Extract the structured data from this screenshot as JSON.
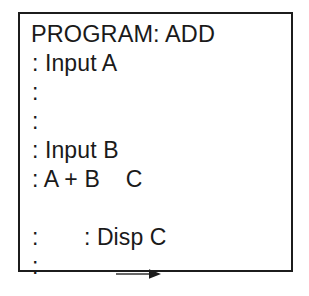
{
  "frame": {
    "border_color": "#1c1c1c",
    "background_color": "#ffffff"
  },
  "program": {
    "text_color": "#1a1a1a",
    "title": "PROGRAM: ADD",
    "lines": [
      {
        "text": ": Input A",
        "has_arrow": false
      },
      {
        "text": ":",
        "has_arrow": false
      },
      {
        "text": ":",
        "has_arrow": false
      },
      {
        "text": ": Input B",
        "has_arrow": false
      },
      {
        "text": ": A + B    C",
        "has_arrow": false
      },
      {
        "text": ": Disp C",
        "has_arrow": true
      },
      {
        "text": ":",
        "has_arrow": false
      },
      {
        "text": ":",
        "has_arrow": false
      }
    ]
  }
}
